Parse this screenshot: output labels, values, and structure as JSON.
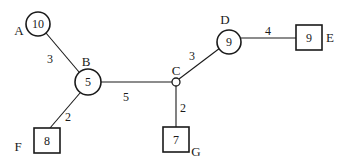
{
  "diagram": {
    "type": "weighted-graph",
    "nodes": [
      {
        "id": "A",
        "label": "A",
        "value": "10",
        "shape": "circle"
      },
      {
        "id": "B",
        "label": "B",
        "value": "5",
        "shape": "circle"
      },
      {
        "id": "C",
        "label": "C",
        "value": "",
        "shape": "small-circle"
      },
      {
        "id": "D",
        "label": "D",
        "value": "9",
        "shape": "circle"
      },
      {
        "id": "E",
        "label": "E",
        "value": "9",
        "shape": "square"
      },
      {
        "id": "F",
        "label": "F",
        "value": "8",
        "shape": "square"
      },
      {
        "id": "G",
        "label": "G",
        "value": "7",
        "shape": "square"
      }
    ],
    "edges": [
      {
        "from": "A",
        "to": "B",
        "weight": "3"
      },
      {
        "from": "B",
        "to": "C",
        "weight": "5"
      },
      {
        "from": "C",
        "to": "D",
        "weight": "3"
      },
      {
        "from": "D",
        "to": "E",
        "weight": "4"
      },
      {
        "from": "B",
        "to": "F",
        "weight": "2"
      },
      {
        "from": "C",
        "to": "G",
        "weight": "2"
      }
    ],
    "colors": {
      "stroke": "#1a1a1a",
      "background": "#ffffff"
    }
  }
}
